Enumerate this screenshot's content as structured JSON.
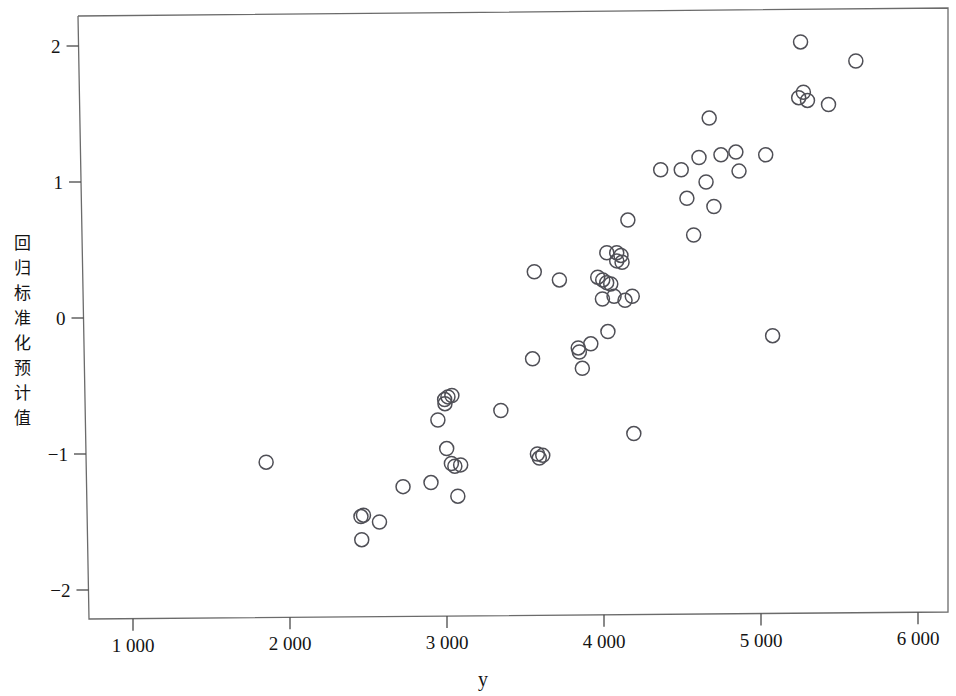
{
  "chart_data": {
    "type": "scatter",
    "title": "",
    "xlabel": "y",
    "ylabel": "回归标准化预计值",
    "ylabel_chars": [
      "回",
      "归",
      "标",
      "准",
      "化",
      "预",
      "计",
      "值"
    ],
    "xlim": [
      700,
      6200
    ],
    "ylim": [
      -2.35,
      2.25
    ],
    "xticks": [
      1000,
      2000,
      3000,
      4000,
      5000,
      6000
    ],
    "xtick_labels": [
      "1 000",
      "2 000",
      "3 000",
      "4 000",
      "5 000",
      "6 000"
    ],
    "yticks": [
      2,
      1,
      0,
      -1,
      -2
    ],
    "ytick_labels": [
      "2",
      "1",
      "0",
      "−1",
      "−2"
    ],
    "grid": false,
    "legend": null,
    "marker": "open-circle",
    "marker_color": "#4f4f56",
    "marker_size": 9,
    "n_points": 63,
    "points": [
      {
        "x": 1848,
        "y": -1.06
      },
      {
        "x": 2452,
        "y": -1.46
      },
      {
        "x": 2457,
        "y": -1.63
      },
      {
        "x": 2570,
        "y": -1.5
      },
      {
        "x": 2720,
        "y": -1.24
      },
      {
        "x": 2898,
        "y": -1.21
      },
      {
        "x": 2942,
        "y": -0.75
      },
      {
        "x": 2987,
        "y": -0.63
      },
      {
        "x": 3006,
        "y": -0.58
      },
      {
        "x": 3031,
        "y": -0.57
      },
      {
        "x": 2998,
        "y": -0.96
      },
      {
        "x": 3050,
        "y": -1.09
      },
      {
        "x": 3087,
        "y": -1.08
      },
      {
        "x": 3069,
        "y": -1.31
      },
      {
        "x": 3343,
        "y": -0.68
      },
      {
        "x": 3556,
        "y": 0.34
      },
      {
        "x": 3545,
        "y": -0.3
      },
      {
        "x": 3576,
        "y": -1.0
      },
      {
        "x": 3588,
        "y": -1.03
      },
      {
        "x": 3716,
        "y": 0.28
      },
      {
        "x": 3836,
        "y": -0.22
      },
      {
        "x": 3843,
        "y": -0.25
      },
      {
        "x": 3862,
        "y": -0.37
      },
      {
        "x": 3916,
        "y": -0.19
      },
      {
        "x": 3992,
        "y": 0.28
      },
      {
        "x": 4017,
        "y": 0.26
      },
      {
        "x": 4018,
        "y": 0.48
      },
      {
        "x": 4081,
        "y": 0.48
      },
      {
        "x": 4043,
        "y": 0.25
      },
      {
        "x": 4025,
        "y": -0.1
      },
      {
        "x": 4064,
        "y": 0.16
      },
      {
        "x": 4134,
        "y": 0.13
      },
      {
        "x": 4081,
        "y": 0.42
      },
      {
        "x": 4115,
        "y": 0.41
      },
      {
        "x": 4152,
        "y": 0.72
      },
      {
        "x": 4190,
        "y": -0.85
      },
      {
        "x": 4361,
        "y": 1.09
      },
      {
        "x": 4528,
        "y": 0.88
      },
      {
        "x": 4571,
        "y": 0.61
      },
      {
        "x": 4605,
        "y": 1.18
      },
      {
        "x": 4650,
        "y": 1.0
      },
      {
        "x": 4670,
        "y": 1.47
      },
      {
        "x": 4700,
        "y": 0.82
      },
      {
        "x": 4840,
        "y": 1.22
      },
      {
        "x": 4860,
        "y": 1.08
      },
      {
        "x": 5030,
        "y": 1.2
      },
      {
        "x": 5074,
        "y": -0.13
      },
      {
        "x": 5252,
        "y": 2.03
      },
      {
        "x": 5270,
        "y": 1.66
      },
      {
        "x": 5296,
        "y": 1.6
      },
      {
        "x": 5430,
        "y": 1.57
      },
      {
        "x": 5604,
        "y": 1.89
      },
      {
        "x": 3990,
        "y": 0.14
      },
      {
        "x": 3960,
        "y": 0.3
      },
      {
        "x": 4108,
        "y": 0.46
      },
      {
        "x": 4180,
        "y": 0.16
      },
      {
        "x": 3610,
        "y": -1.01
      },
      {
        "x": 2985,
        "y": -0.6
      },
      {
        "x": 4492,
        "y": 1.09
      },
      {
        "x": 4745,
        "y": 1.2
      },
      {
        "x": 5240,
        "y": 1.62
      },
      {
        "x": 2468,
        "y": -1.45
      },
      {
        "x": 3028,
        "y": -1.07
      }
    ]
  }
}
